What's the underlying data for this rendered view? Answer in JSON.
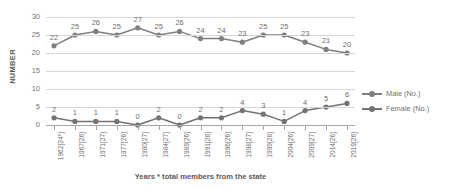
{
  "chart_data": {
    "type": "line",
    "title": "",
    "xlabel": "Years  * total members from the state",
    "ylabel": "NUMBER",
    "ylim": [
      0,
      30
    ],
    "yticks": [
      0,
      5,
      10,
      15,
      20,
      25,
      30
    ],
    "grid": true,
    "legend_position": "right",
    "categories": [
      "1962[24*]",
      "1967[26]",
      "1971[27]",
      "1977[26]",
      "1980[27]",
      "1984[27]",
      "1989[26]",
      "1991[26]",
      "1996[26]",
      "1998[27]",
      "1999[28]",
      "2004[26]",
      "2009[27]",
      "2014[26]",
      "2019[26]"
    ],
    "series": [
      {
        "name": "Male (No.)",
        "color": "#808080",
        "values": [
          22,
          25,
          26,
          25,
          27,
          25,
          26,
          24,
          24,
          23,
          25,
          25,
          23,
          21,
          20
        ]
      },
      {
        "name": "Female (No.)",
        "color": "#737373",
        "values": [
          2,
          1,
          1,
          1,
          0,
          2,
          0,
          2,
          2,
          4,
          3,
          1,
          4,
          5,
          6
        ]
      }
    ]
  },
  "axes": {
    "y_title": "NUMBER",
    "x_title": "Years  * total members from the state",
    "y_tick_labels": [
      "30",
      "25",
      "20",
      "15",
      "10",
      "5",
      "0"
    ]
  },
  "legend": {
    "items": [
      {
        "label": "Male (No.)"
      },
      {
        "label": "Female (No.)"
      }
    ]
  },
  "colors": {
    "male": "#808080",
    "female": "#737373",
    "grid": "#d6d6d6",
    "axis": "#a6a6a6",
    "text": "#6e6e6e"
  }
}
